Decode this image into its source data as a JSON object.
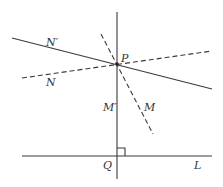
{
  "diagram": {
    "points": {
      "P": {
        "label": "P"
      },
      "Q": {
        "label": "Q"
      }
    },
    "lines": {
      "L": {
        "label": "L",
        "style": "solid"
      },
      "M_prime": {
        "label": "M′",
        "style": "solid"
      },
      "M": {
        "label": "M",
        "style": "dashed"
      },
      "N_prime": {
        "label": "N′",
        "style": "solid"
      },
      "N": {
        "label": "N",
        "style": "dashed"
      }
    },
    "right_angle_at": "Q",
    "colors": {
      "stroke": "#3a3a3a",
      "background": "#ffffff"
    }
  }
}
